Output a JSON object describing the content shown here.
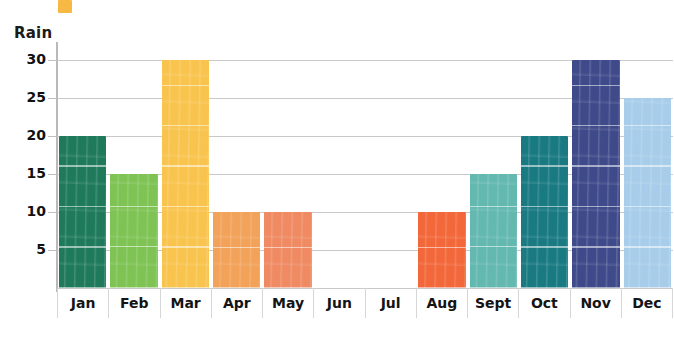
{
  "legend_swatch": {
    "name": "orange-swatch",
    "color": "#f7b844"
  },
  "axes": {
    "ylabel": "Rain",
    "yticks": [
      30,
      25,
      20,
      15,
      10,
      5
    ],
    "xlabels": [
      "Jan",
      "Feb",
      "Mar",
      "Apr",
      "May",
      "Jun",
      "Jul",
      "Aug",
      "Sept",
      "Oct",
      "Nov",
      "Dec"
    ]
  },
  "chart_data": {
    "type": "bar",
    "title": "",
    "xlabel": "",
    "ylabel": "Rain",
    "categories": [
      "Jan",
      "Feb",
      "Mar",
      "Apr",
      "May",
      "Jun",
      "Jul",
      "Aug",
      "Sept",
      "Oct",
      "Nov",
      "Dec"
    ],
    "values": [
      20,
      15,
      30,
      10,
      10,
      0,
      0,
      10,
      15,
      20,
      30,
      25
    ],
    "colors": [
      "#1f7a5c",
      "#7ec354",
      "#f9c44e",
      "#f2a259",
      "#ef8a63",
      "#ffffff",
      "#ffffff",
      "#f2683a",
      "#63b8b0",
      "#197a82",
      "#3f4a8a",
      "#a7cdea"
    ],
    "ylim": [
      0,
      32
    ],
    "yticks": [
      5,
      10,
      15,
      20,
      25,
      30
    ],
    "grid": true,
    "legend": "none",
    "bars": [
      {
        "label": "Jan",
        "value": 20,
        "color": "#1f7a5c"
      },
      {
        "label": "Feb",
        "value": 15,
        "color": "#7ec354"
      },
      {
        "label": "Mar",
        "value": 30,
        "color": "#f9c44e"
      },
      {
        "label": "Apr",
        "value": 10,
        "color": "#f2a259"
      },
      {
        "label": "May",
        "value": 10,
        "color": "#ef8a63"
      },
      {
        "label": "Jun",
        "value": 0,
        "color": "#ffffff"
      },
      {
        "label": "Jul",
        "value": 0,
        "color": "#ffffff"
      },
      {
        "label": "Aug",
        "value": 10,
        "color": "#f2683a"
      },
      {
        "label": "Sept",
        "value": 15,
        "color": "#63b8b0"
      },
      {
        "label": "Oct",
        "value": 20,
        "color": "#197a82"
      },
      {
        "label": "Nov",
        "value": 30,
        "color": "#3f4a8a"
      },
      {
        "label": "Dec",
        "value": 25,
        "color": "#a7cdea"
      }
    ]
  }
}
